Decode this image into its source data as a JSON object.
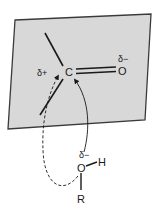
{
  "diagram": {
    "type": "nucleophilic-addition-to-carbonyl",
    "colors": {
      "plane_fill": "#d8d8d8",
      "plane_edge": "#3a3a3a",
      "ink": "#1a1a1a",
      "background": "#ffffff"
    },
    "carbonyl": {
      "carbon_label": "C",
      "carbon_charge": "δ+",
      "oxygen_label": "O",
      "oxygen_charge": "δ−"
    },
    "nucleophile": {
      "oxygen_label": "O",
      "oxygen_charge": "δ−",
      "hydrogen_label": "H",
      "r_group_label": "R"
    },
    "arrows": [
      {
        "style": "solid",
        "from": "nucleophile-oxygen",
        "to": "carbonyl-carbon",
        "path": "front"
      },
      {
        "style": "dashed",
        "from": "nucleophile-oxygen",
        "to": "carbonyl-carbon",
        "path": "behind-plane"
      }
    ]
  }
}
